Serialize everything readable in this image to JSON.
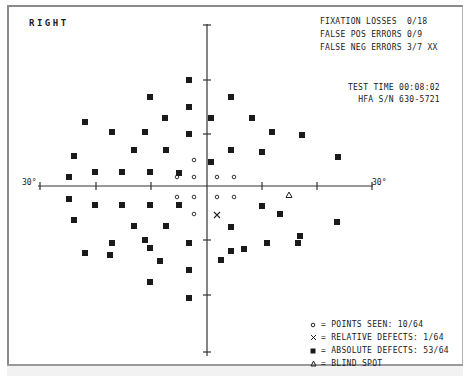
{
  "header": {
    "eye": "RIGHT"
  },
  "reliability": {
    "fixation_losses": "FIXATION LOSSES  0/18",
    "false_pos": "FALSE POS ERRORS 0/9",
    "false_neg": "FALSE NEG ERRORS 3/7 XX"
  },
  "test_info": {
    "test_time": "TEST TIME 00:08:02",
    "serial": "HFA S/N 630-5721"
  },
  "axis_labels": {
    "left": "30°",
    "right": "30°"
  },
  "legend": {
    "seen": "= POINTS SEEN: 10/64",
    "relative": "= RELATIVE DEFECTS: 1/64",
    "absolute": "= ABSOLUTE DEFECTS: 53/64",
    "blind": "= BLIND SPOT"
  },
  "chart_data": {
    "type": "scatter",
    "title": "RIGHT",
    "xlabel": "",
    "ylabel": "",
    "xlim": [
      -30,
      30
    ],
    "ylim": [
      -30,
      30
    ],
    "axis_labels": [
      "30°",
      "30°"
    ],
    "grid": false,
    "legend": [
      "POINTS SEEN: 10/64",
      "RELATIVE DEFECTS: 1/64",
      "ABSOLUTE DEFECTS: 53/64",
      "BLIND SPOT"
    ],
    "legend_position": "bottom-right",
    "colors": {
      "ink": "#1a1a1a",
      "axis": "#333333"
    },
    "series": [
      {
        "name": "seen",
        "symbol": "circle",
        "points": [
          [
            194,
            160
          ],
          [
            177,
            177
          ],
          [
            194,
            177
          ],
          [
            217,
            177
          ],
          [
            234,
            177
          ],
          [
            177,
            197
          ],
          [
            194,
            197
          ],
          [
            217,
            197
          ],
          [
            234,
            197
          ],
          [
            194,
            214
          ]
        ]
      },
      {
        "name": "relative",
        "symbol": "x",
        "points": [
          [
            217,
            215
          ]
        ]
      },
      {
        "name": "blind_spot",
        "symbol": "triangle",
        "points": [
          [
            289,
            195
          ]
        ]
      },
      {
        "name": "absolute",
        "symbol": "square",
        "points": [
          [
            189,
            80
          ],
          [
            150,
            97
          ],
          [
            231,
            97
          ],
          [
            189,
            107
          ],
          [
            85,
            122
          ],
          [
            165,
            118
          ],
          [
            211,
            118
          ],
          [
            252,
            118
          ],
          [
            112,
            132
          ],
          [
            145,
            132
          ],
          [
            189,
            134
          ],
          [
            272,
            132
          ],
          [
            302,
            135
          ],
          [
            134,
            150
          ],
          [
            166,
            150
          ],
          [
            231,
            150
          ],
          [
            262,
            152
          ],
          [
            74,
            156
          ],
          [
            211,
            162
          ],
          [
            95,
            172
          ],
          [
            122,
            172
          ],
          [
            150,
            172
          ],
          [
            179,
            173
          ],
          [
            69,
            177
          ],
          [
            338,
            157
          ],
          [
            69,
            199
          ],
          [
            95,
            205
          ],
          [
            122,
            205
          ],
          [
            150,
            205
          ],
          [
            179,
            205
          ],
          [
            74,
            220
          ],
          [
            262,
            206
          ],
          [
            337,
            222
          ],
          [
            134,
            226
          ],
          [
            166,
            226
          ],
          [
            231,
            227
          ],
          [
            298,
            243
          ],
          [
            112,
            243
          ],
          [
            145,
            240
          ],
          [
            189,
            243
          ],
          [
            267,
            243
          ],
          [
            85,
            253
          ],
          [
            150,
            248
          ],
          [
            189,
            270
          ],
          [
            231,
            251
          ],
          [
            189,
            298
          ],
          [
            150,
            282
          ],
          [
            244,
            249
          ],
          [
            221,
            260
          ],
          [
            110,
            255
          ],
          [
            280,
            214
          ],
          [
            300,
            236
          ],
          [
            160,
            261
          ]
        ]
      }
    ]
  }
}
